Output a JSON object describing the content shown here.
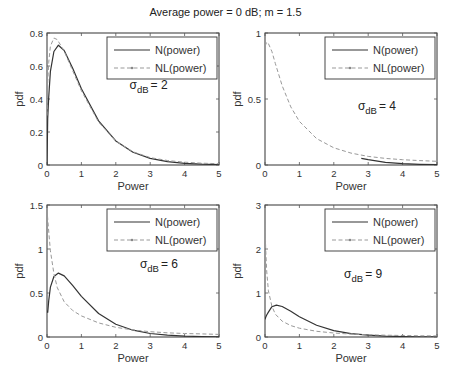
{
  "figure": {
    "title": "Average power = 0 dB;  m = 1.5"
  },
  "chart_data": [
    {
      "type": "line",
      "panel": "top-left",
      "box": [
        47,
        33,
        219,
        165
      ],
      "xlim": [
        0,
        5
      ],
      "ylim": [
        0,
        0.8
      ],
      "xticks": [
        0,
        1,
        2,
        3,
        4,
        5
      ],
      "yticks": [
        0,
        0.2,
        0.4,
        0.6,
        0.8
      ],
      "ytick_labels": [
        "0",
        "0.2",
        "0.4",
        "0.6",
        "0.8"
      ],
      "xlabel": "Power",
      "ylabel": "pdf",
      "annotation": {
        "sigma_label": "σ",
        "sub": "dB",
        "value": "= 2",
        "x": 2.4,
        "y": 0.46
      },
      "legend": [
        {
          "label": "N(power)",
          "style": "solid"
        },
        {
          "label": "NL(power)",
          "style": "dashed"
        }
      ],
      "series": [
        {
          "name": "N(power)",
          "x": [
            0,
            0.02,
            0.05,
            0.1,
            0.2,
            0.33,
            0.5,
            0.75,
            1,
            1.5,
            2,
            2.5,
            3,
            3.5,
            4,
            4.5,
            5
          ],
          "values": [
            0,
            0.28,
            0.41,
            0.567,
            0.688,
            0.726,
            0.694,
            0.584,
            0.462,
            0.267,
            0.146,
            0.077,
            0.04,
            0.02,
            0.01,
            0.005,
            0.0025
          ]
        },
        {
          "name": "NL(power)",
          "x": [
            0,
            0.02,
            0.05,
            0.1,
            0.2,
            0.3,
            0.5,
            0.75,
            1,
            1.5,
            2,
            2.5,
            3,
            3.5,
            4,
            4.5,
            5
          ],
          "values": [
            0.3,
            0.5,
            0.62,
            0.72,
            0.77,
            0.76,
            0.69,
            0.57,
            0.45,
            0.26,
            0.145,
            0.08,
            0.045,
            0.027,
            0.017,
            0.011,
            0.008
          ]
        }
      ]
    },
    {
      "type": "line",
      "panel": "top-right",
      "box": [
        265,
        33,
        437,
        165
      ],
      "xlim": [
        0,
        5
      ],
      "ylim": [
        0,
        1
      ],
      "xticks": [
        0,
        1,
        2,
        3,
        4,
        5
      ],
      "yticks": [
        0,
        0.5,
        1
      ],
      "ytick_labels": [
        "0",
        "0.5",
        "1"
      ],
      "xlabel": "Power",
      "ylabel": "pdf",
      "annotation": {
        "sigma_label": "σ",
        "sub": "dB",
        "value": "= 4",
        "x": 2.7,
        "y": 0.42
      },
      "legend": [
        {
          "label": "N(power)",
          "style": "solid"
        },
        {
          "label": "NL(power)",
          "style": "dashed"
        }
      ],
      "series": [
        {
          "name": "N(power)",
          "x": [
            2.8,
            3,
            3.5,
            4,
            4.5,
            5
          ],
          "values": [
            0.05,
            0.04,
            0.02,
            0.01,
            0.005,
            0.0025
          ]
        },
        {
          "name": "NL(power)",
          "x": [
            0,
            0.05,
            0.1,
            0.2,
            0.3,
            0.5,
            0.75,
            1,
            1.5,
            2,
            2.5,
            3,
            3.5,
            4,
            4.5,
            5
          ],
          "values": [
            0.9,
            0.93,
            0.92,
            0.86,
            0.77,
            0.6,
            0.44,
            0.33,
            0.2,
            0.13,
            0.09,
            0.065,
            0.05,
            0.04,
            0.033,
            0.028
          ]
        }
      ]
    },
    {
      "type": "line",
      "panel": "bottom-left",
      "box": [
        47,
        205,
        219,
        337
      ],
      "xlim": [
        0,
        5
      ],
      "ylim": [
        0,
        1.5
      ],
      "xticks": [
        0,
        1,
        2,
        3,
        4,
        5
      ],
      "yticks": [
        0,
        0.5,
        1,
        1.5
      ],
      "ytick_labels": [
        "0",
        "0.5",
        "1",
        "1.5"
      ],
      "xlabel": "Power",
      "ylabel": "pdf",
      "annotation": {
        "sigma_label": "σ",
        "sub": "dB",
        "value": "= 6",
        "x": 2.7,
        "y": 0.78
      },
      "legend": [
        {
          "label": "N(power)",
          "style": "solid"
        },
        {
          "label": "NL(power)",
          "style": "dashed"
        }
      ],
      "series": [
        {
          "name": "N(power)",
          "x": [
            0,
            0.02,
            0.05,
            0.1,
            0.2,
            0.33,
            0.5,
            0.75,
            1,
            1.5,
            2,
            2.5,
            3,
            3.5,
            4,
            4.5,
            5
          ],
          "values": [
            0.3,
            0.28,
            0.41,
            0.567,
            0.688,
            0.726,
            0.694,
            0.584,
            0.462,
            0.267,
            0.146,
            0.077,
            0.04,
            0.02,
            0.01,
            0.005,
            0.0025
          ]
        },
        {
          "name": "NL(power)",
          "x": [
            0,
            0.03,
            0.06,
            0.1,
            0.2,
            0.3,
            0.5,
            0.75,
            1,
            1.5,
            2,
            2.5,
            3,
            3.5,
            4,
            4.5,
            5
          ],
          "values": [
            1.45,
            1.3,
            1.15,
            0.98,
            0.72,
            0.56,
            0.4,
            0.3,
            0.24,
            0.16,
            0.11,
            0.08,
            0.06,
            0.048,
            0.04,
            0.035,
            0.03
          ]
        }
      ]
    },
    {
      "type": "line",
      "panel": "bottom-right",
      "box": [
        265,
        205,
        437,
        337
      ],
      "xlim": [
        0,
        5
      ],
      "ylim": [
        0,
        3
      ],
      "xticks": [
        0,
        1,
        2,
        3,
        4,
        5
      ],
      "yticks": [
        0,
        1,
        2,
        3
      ],
      "ytick_labels": [
        "0",
        "1",
        "2",
        "3"
      ],
      "xlabel": "Power",
      "ylabel": "pdf",
      "annotation": {
        "sigma_label": "σ",
        "sub": "dB",
        "value": "= 9",
        "x": 2.3,
        "y": 1.35
      },
      "legend": [
        {
          "label": "N(power)",
          "style": "solid"
        },
        {
          "label": "NL(power)",
          "style": "dashed"
        }
      ],
      "series": [
        {
          "name": "N(power)",
          "x": [
            0,
            0.02,
            0.05,
            0.1,
            0.2,
            0.33,
            0.5,
            0.75,
            1,
            1.5,
            2,
            2.5,
            3,
            3.5,
            4,
            4.5,
            5
          ],
          "values": [
            0.4,
            0.45,
            0.5,
            0.567,
            0.688,
            0.726,
            0.694,
            0.584,
            0.462,
            0.267,
            0.146,
            0.077,
            0.04,
            0.02,
            0.01,
            0.005,
            0.0025
          ]
        },
        {
          "name": "NL(power)",
          "x": [
            0,
            0.02,
            0.05,
            0.1,
            0.2,
            0.3,
            0.5,
            0.75,
            1,
            1.5,
            2,
            2.5,
            3,
            3.5,
            4,
            4.5,
            5
          ],
          "values": [
            2.7,
            2.0,
            1.5,
            1.05,
            0.7,
            0.52,
            0.36,
            0.26,
            0.2,
            0.13,
            0.09,
            0.065,
            0.05,
            0.04,
            0.033,
            0.028,
            0.024
          ]
        }
      ]
    }
  ]
}
